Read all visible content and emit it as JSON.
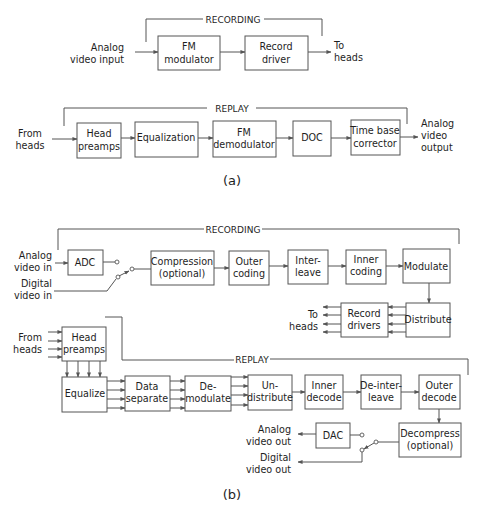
{
  "figure_a": {
    "caption": "(a)",
    "recording": {
      "title": "RECORDING",
      "input": [
        "Analog",
        "video input"
      ],
      "blocks": [
        {
          "id": "fm-modulator",
          "lines": [
            "FM",
            "modulator"
          ]
        },
        {
          "id": "record-driver",
          "lines": [
            "Record",
            "driver"
          ]
        }
      ],
      "output": [
        "To",
        "heads"
      ]
    },
    "replay": {
      "title": "REPLAY",
      "input": [
        "From",
        "heads"
      ],
      "blocks": [
        {
          "id": "head-preamps",
          "lines": [
            "Head",
            "preamps"
          ]
        },
        {
          "id": "equalization",
          "lines": [
            "Equalization"
          ]
        },
        {
          "id": "fm-demodulator",
          "lines": [
            "FM",
            "demodulator"
          ]
        },
        {
          "id": "doc",
          "lines": [
            "DOC"
          ]
        },
        {
          "id": "time-base-corrector",
          "lines": [
            "Time base",
            "corrector"
          ]
        }
      ],
      "output": [
        "Analog",
        "video",
        "output"
      ]
    }
  },
  "figure_b": {
    "caption": "(b)",
    "recording": {
      "title": "RECORDING",
      "inputs": {
        "analog": [
          "Analog",
          "video in"
        ],
        "digital": [
          "Digital",
          "video in"
        ]
      },
      "blocks": [
        {
          "id": "adc",
          "lines": [
            "ADC"
          ]
        },
        {
          "id": "compression",
          "lines": [
            "Compression",
            "(optional)"
          ]
        },
        {
          "id": "outer-coding",
          "lines": [
            "Outer",
            "coding"
          ]
        },
        {
          "id": "interleave",
          "lines": [
            "Inter-",
            "leave"
          ]
        },
        {
          "id": "inner-coding",
          "lines": [
            "Inner",
            "coding"
          ]
        },
        {
          "id": "modulate",
          "lines": [
            "Modulate"
          ]
        },
        {
          "id": "distribute",
          "lines": [
            "Distribute"
          ]
        },
        {
          "id": "record-drivers",
          "lines": [
            "Record",
            "drivers"
          ]
        }
      ],
      "output": [
        "To",
        "heads"
      ]
    },
    "replay": {
      "title": "REPLAY",
      "input": [
        "From",
        "heads"
      ],
      "blocks": [
        {
          "id": "head-preamps",
          "lines": [
            "Head",
            "preamps"
          ]
        },
        {
          "id": "equalize",
          "lines": [
            "Equalize"
          ]
        },
        {
          "id": "data-separate",
          "lines": [
            "Data",
            "separate"
          ]
        },
        {
          "id": "demodulate",
          "lines": [
            "De-",
            "modulate"
          ]
        },
        {
          "id": "undistribute",
          "lines": [
            "Un-",
            "distribute"
          ]
        },
        {
          "id": "inner-decode",
          "lines": [
            "Inner",
            "decode"
          ]
        },
        {
          "id": "deinterleave",
          "lines": [
            "De-inter-",
            "leave"
          ]
        },
        {
          "id": "outer-decode",
          "lines": [
            "Outer",
            "decode"
          ]
        },
        {
          "id": "decompress",
          "lines": [
            "Decompress",
            "(optional)"
          ]
        },
        {
          "id": "dac",
          "lines": [
            "DAC"
          ]
        }
      ],
      "outputs": {
        "analog": [
          "Analog",
          "video out"
        ],
        "digital": [
          "Digital",
          "video out"
        ]
      }
    }
  }
}
